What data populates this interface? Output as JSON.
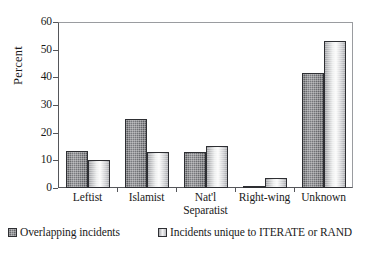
{
  "chart_data": {
    "type": "bar",
    "title": "",
    "subtitle": "",
    "xlabel": "",
    "ylabel": "Percent",
    "ylim": [
      0,
      60
    ],
    "yticks": [
      0,
      10,
      20,
      30,
      40,
      50,
      60
    ],
    "ytick_labels": [
      "0",
      "10",
      "20",
      "30",
      "40",
      "50",
      "60"
    ],
    "grid": false,
    "legend_position": "bottom",
    "categories": [
      "Leftist",
      "Islamist",
      "Nat'l Separatist",
      "Right-wing",
      "Unknown"
    ],
    "category_lines": [
      [
        "Leftist"
      ],
      [
        "Islamist"
      ],
      [
        "Nat'l",
        "Separatist"
      ],
      [
        "Right-wing"
      ],
      [
        "Unknown"
      ]
    ],
    "series": [
      {
        "name": "Overlapping incidents",
        "color": "#6b6c70",
        "pattern": "dark-crosshatch",
        "values": [
          13.3,
          25.0,
          13.0,
          0.8,
          41.7
        ]
      },
      {
        "name": "Incidents unique to ITERATE or RAND",
        "color": "#dcdde0",
        "pattern": "light-gradient",
        "values": [
          10.0,
          13.0,
          15.2,
          3.7,
          53.2
        ]
      }
    ]
  },
  "axes": {
    "y_axis_label": "Percent"
  },
  "legend": {
    "items": [
      {
        "label": "Overlapping incidents"
      },
      {
        "label": "Incidents unique to ITERATE or RAND"
      }
    ]
  },
  "colors": {
    "axis": "#55565a",
    "frame": "#9a9ca0",
    "series1": "#6b6c70",
    "series2": "#dcdde0",
    "background": "#ffffff",
    "text": "#1a1a1a"
  }
}
